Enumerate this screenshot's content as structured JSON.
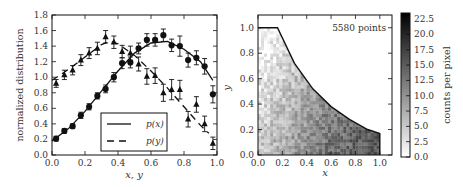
{
  "chart_data": [
    {
      "type": "scatter",
      "title": "",
      "xlabel": "x, y",
      "ylabel": "normalized distribution",
      "xlim": [
        0.0,
        1.0
      ],
      "ylim": [
        0.0,
        1.8
      ],
      "xticks": [
        "0.0",
        "0.2",
        "0.4",
        "0.6",
        "0.8",
        "1.0"
      ],
      "yticks": [
        "0.0",
        "0.2",
        "0.4",
        "0.6",
        "0.8",
        "1.0",
        "1.2",
        "1.4",
        "1.6",
        "1.8"
      ],
      "grid": false,
      "legend_position": "lower center",
      "x": [
        0.025,
        0.075,
        0.125,
        0.175,
        0.225,
        0.275,
        0.325,
        0.375,
        0.425,
        0.475,
        0.525,
        0.575,
        0.625,
        0.675,
        0.725,
        0.775,
        0.825,
        0.875,
        0.925,
        0.975
      ],
      "series": [
        {
          "name": "p(x)",
          "marker": "circle",
          "line": "solid",
          "values": [
            0.21,
            0.31,
            0.37,
            0.51,
            0.62,
            0.76,
            0.85,
            1.0,
            1.18,
            1.19,
            1.37,
            1.48,
            1.48,
            1.54,
            1.41,
            1.4,
            1.22,
            1.25,
            1.14,
            0.78
          ],
          "errors": [
            0.03,
            0.03,
            0.03,
            0.04,
            0.04,
            0.04,
            0.05,
            0.06,
            0.07,
            0.07,
            0.07,
            0.08,
            0.08,
            0.08,
            0.08,
            0.13,
            0.09,
            0.09,
            0.1,
            0.11
          ],
          "curve": [
            [
              0.0,
              0.18
            ],
            [
              0.1,
              0.34
            ],
            [
              0.2,
              0.56
            ],
            [
              0.3,
              0.82
            ],
            [
              0.4,
              1.08
            ],
            [
              0.5,
              1.31
            ],
            [
              0.6,
              1.44
            ],
            [
              0.7,
              1.46
            ],
            [
              0.8,
              1.36
            ],
            [
              0.9,
              1.2
            ],
            [
              0.975,
              0.96
            ]
          ]
        },
        {
          "name": "p(y)",
          "marker": "triangle",
          "line": "dashed",
          "values": [
            0.92,
            1.03,
            1.09,
            1.22,
            1.31,
            1.37,
            1.52,
            1.45,
            1.33,
            1.31,
            1.17,
            1.01,
            1.02,
            0.8,
            0.84,
            0.84,
            0.46,
            0.65,
            0.4,
            0.15
          ],
          "errors": [
            0.05,
            0.06,
            0.06,
            0.07,
            0.07,
            0.08,
            0.08,
            0.08,
            0.08,
            0.09,
            0.09,
            0.1,
            0.1,
            0.11,
            0.13,
            0.12,
            0.1,
            0.1,
            0.1,
            0.08
          ],
          "curve": [
            [
              0.0,
              0.96
            ],
            [
              0.1,
              1.1
            ],
            [
              0.2,
              1.26
            ],
            [
              0.3,
              1.42
            ],
            [
              0.35,
              1.46
            ],
            [
              0.4,
              1.43
            ],
            [
              0.5,
              1.28
            ],
            [
              0.6,
              1.08
            ],
            [
              0.7,
              0.86
            ],
            [
              0.8,
              0.62
            ],
            [
              0.9,
              0.38
            ],
            [
              0.95,
              0.28
            ]
          ]
        }
      ]
    },
    {
      "type": "heatmap",
      "title": "",
      "xlabel": "x",
      "ylabel": "y",
      "xlim": [
        0.0,
        1.1
      ],
      "ylim": [
        0.0,
        1.1
      ],
      "xticks": [
        "0.0",
        "0.2",
        "0.4",
        "0.6",
        "0.8",
        "1.0"
      ],
      "yticks": [
        "0.0",
        "0.2",
        "0.4",
        "0.6",
        "0.8",
        "1.0"
      ],
      "annotation": "5580 points",
      "colorbar": {
        "label": "counts per pixel",
        "ticks": [
          "0.0",
          "2.5",
          "5.0",
          "7.5",
          "10.0",
          "12.5",
          "15.0",
          "17.5",
          "20.0",
          "22.5"
        ],
        "range": [
          0.0,
          23.5
        ],
        "colormap": "gray_r"
      },
      "boundary": [
        [
          0.0,
          1.0
        ],
        [
          0.16,
          1.0
        ],
        [
          0.3,
          0.72
        ],
        [
          0.45,
          0.52
        ],
        [
          0.6,
          0.38
        ],
        [
          0.75,
          0.28
        ],
        [
          0.9,
          0.2
        ],
        [
          1.0,
          0.17
        ],
        [
          1.0,
          0.0
        ]
      ]
    }
  ]
}
